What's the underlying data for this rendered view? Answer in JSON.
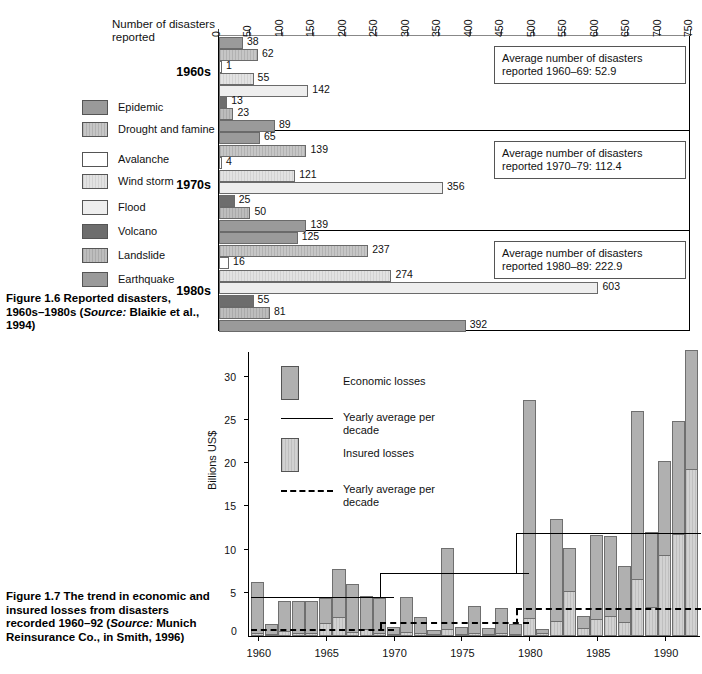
{
  "figure16": {
    "axis_title": "Number of disasters reported",
    "axis": {
      "min": 0,
      "max": 750,
      "step": 50,
      "ticks": [
        "0",
        "50",
        "100",
        "150",
        "200",
        "250",
        "300",
        "350",
        "400",
        "450",
        "500",
        "550",
        "600",
        "650",
        "700",
        "750"
      ]
    },
    "legend": [
      {
        "label": "Epidemic",
        "key": "epidemic"
      },
      {
        "label": "Drought and famine",
        "key": "drought"
      },
      {
        "label": "Avalanche",
        "key": "avalanche"
      },
      {
        "label": "Wind storm",
        "key": "wind"
      },
      {
        "label": "Flood",
        "key": "flood"
      },
      {
        "label": "Volcano",
        "key": "volcano"
      },
      {
        "label": "Landslide",
        "key": "landslide"
      },
      {
        "label": "Earthquake",
        "key": "earthquake"
      }
    ],
    "decades": [
      {
        "label": "1960s",
        "note": "Average number of disasters reported 1960–69: 52.9",
        "values": [
          38,
          62,
          1,
          55,
          142,
          13,
          23,
          89
        ]
      },
      {
        "label": "1970s",
        "note": "Average number of disasters reported 1970–79: 112.4",
        "values": [
          65,
          139,
          4,
          121,
          356,
          25,
          50,
          139
        ]
      },
      {
        "label": "1980s",
        "note": "Average number of disasters reported 1980–89: 222.9",
        "values": [
          125,
          237,
          16,
          274,
          603,
          55,
          81,
          392
        ]
      }
    ],
    "caption_a": "Figure 1.6   Reported disasters, 1960s–1980s (",
    "caption_src": "Source:",
    "caption_b": " Blaikie et al., 1994)"
  },
  "figure17": {
    "ylabel": "Billions US$",
    "legend": [
      {
        "label": "Economic losses",
        "type": "bar-economic"
      },
      {
        "label": "Yearly average per decade",
        "type": "line-solid"
      },
      {
        "label": "Insured losses",
        "type": "bar-insured"
      },
      {
        "label": "Yearly average per decade",
        "type": "line-dashed"
      }
    ],
    "caption_a": "Figure 1.7   The trend in economic and insured losses from disasters recorded 1960–92 (",
    "caption_src": "Source:",
    "caption_b": " Munich Reinsurance Co., in Smith, 1996)"
  },
  "chart_data": [
    {
      "type": "bar",
      "title": "Reported disasters, 1960s–1980s",
      "orientation": "horizontal",
      "xlabel": "Number of disasters reported",
      "ylabel": "",
      "xlim": [
        0,
        750
      ],
      "xticks": [
        0,
        50,
        100,
        150,
        200,
        250,
        300,
        350,
        400,
        450,
        500,
        550,
        600,
        650,
        700,
        750
      ],
      "grid": false,
      "legend_position": "left",
      "categories": [
        "Epidemic",
        "Drought and famine",
        "Avalanche",
        "Wind storm",
        "Flood",
        "Volcano",
        "Landslide",
        "Earthquake"
      ],
      "series": [
        {
          "name": "1960s",
          "values": [
            38,
            62,
            1,
            55,
            142,
            13,
            23,
            89
          ]
        },
        {
          "name": "1970s",
          "values": [
            65,
            139,
            4,
            121,
            356,
            25,
            50,
            139
          ]
        },
        {
          "name": "1980s",
          "values": [
            125,
            237,
            16,
            274,
            603,
            55,
            81,
            392
          ]
        }
      ],
      "annotations": [
        "Average number of disasters reported 1960–69: 52.9",
        "Average number of disasters reported 1970–79: 112.4",
        "Average number of disasters reported 1980–89: 222.9"
      ]
    },
    {
      "type": "bar",
      "title": "Trend in economic and insured losses from disasters 1960–92",
      "xlabel": "",
      "ylabel": "Billions US$",
      "ylim": [
        0,
        33
      ],
      "yticks": [
        5,
        10,
        15,
        20,
        25,
        30
      ],
      "xticks": [
        1960,
        1965,
        1970,
        1975,
        1980,
        1985,
        1990
      ],
      "grid": false,
      "legend_position": "top-left",
      "x": [
        1960,
        1961,
        1962,
        1963,
        1964,
        1965,
        1966,
        1967,
        1968,
        1969,
        1970,
        1971,
        1972,
        1973,
        1974,
        1975,
        1976,
        1977,
        1978,
        1979,
        1980,
        1981,
        1982,
        1983,
        1984,
        1985,
        1986,
        1987,
        1988,
        1989,
        1990,
        1991,
        1992
      ],
      "series": [
        {
          "name": "Economic losses",
          "values": [
            6.3,
            1.4,
            4.1,
            4.1,
            4.1,
            4.4,
            7.8,
            6.0,
            4.6,
            4.4,
            1.0,
            4.5,
            2.2,
            0.7,
            10.2,
            1.1,
            3.5,
            0.9,
            3.2,
            1.4,
            27.3,
            0.8,
            13.6,
            10.2,
            2.3,
            11.7,
            11.6,
            8.1,
            26.1,
            12.1,
            20.3,
            24.9,
            33.1
          ]
        },
        {
          "name": "Insured losses",
          "values": [
            0.3,
            0.1,
            0.6,
            0.3,
            0.3,
            1.5,
            2.2,
            0.5,
            0.8,
            0.4,
            0.2,
            0.5,
            0.3,
            0.1,
            0.8,
            0.2,
            0.4,
            0.2,
            0.3,
            0.2,
            2.1,
            0.3,
            1.7,
            5.2,
            0.9,
            2.0,
            2.3,
            1.6,
            6.6,
            3.4,
            9.4,
            11.8,
            19.3
          ]
        }
      ],
      "reference_lines": [
        {
          "name": "Yearly average per decade (economic)",
          "style": "solid",
          "segments": [
            {
              "x0": 1960,
              "x1": 1969.5,
              "y": 4.4
            },
            {
              "x0": 1969.5,
              "x1": 1979.5,
              "y": 7.2
            },
            {
              "x0": 1979.5,
              "x1": 1992.5,
              "y": 11.8
            }
          ]
        },
        {
          "name": "Yearly average per decade (insured)",
          "style": "dashed",
          "segments": [
            {
              "x0": 1960,
              "x1": 1969.5,
              "y": 0.6
            },
            {
              "x0": 1969.5,
              "x1": 1979.5,
              "y": 1.4
            },
            {
              "x0": 1979.5,
              "x1": 1992.5,
              "y": 3.0
            }
          ]
        }
      ]
    }
  ]
}
